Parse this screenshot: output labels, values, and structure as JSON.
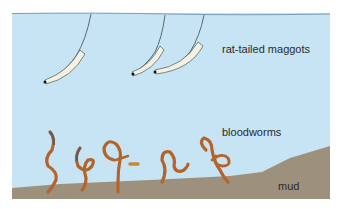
{
  "diagram": {
    "labels": {
      "maggots": "rat-tailed maggots",
      "worms": "bloodworms",
      "mud": "mud"
    },
    "colors": {
      "water": "#c6e4f4",
      "water_surface": "#7a9cb8",
      "mud": "#9d917d",
      "worm": "#b4642a",
      "worm_outline": "#7a3f18",
      "maggot_body": "#f4f1e2",
      "maggot_outline": "#5a6a6a",
      "text": "#2a2a2a"
    }
  }
}
